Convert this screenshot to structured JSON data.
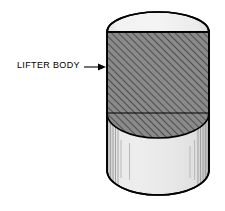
{
  "diagram": {
    "type": "engineering-section-drawing",
    "labels": [
      {
        "id": "lifter-body",
        "text": "LIFTER BODY",
        "text_x": 17,
        "text_y": 60,
        "leader": {
          "from_x": 84,
          "to_x": 106,
          "y": 67,
          "arrowhead": "right"
        }
      }
    ],
    "part": {
      "name": "lifter body",
      "shape": "cylinder",
      "left": 107,
      "right": 209,
      "width": 102,
      "top_apex_y": 12,
      "top_cap_line_y": 32,
      "section_bottom_line_y": 113,
      "section_arc_bottom_y": 138,
      "bottom_arc_y": 195,
      "ellipse_ry_top": 20,
      "ellipse_ry_bottom": 25
    },
    "hatching": {
      "angle_deg": 45,
      "direction": "lower-left-to-upper-right",
      "spacing_px": 5,
      "line_width_px": 1.1
    },
    "colors": {
      "outline": "#000000",
      "section_fill": "#8a8a8a",
      "hatch_line": "#1a1a1a",
      "top_cap_fill": "#f0f0f0",
      "lower_body_fill": "#e6e6e6",
      "shade_line": "#9a9a9a",
      "background": "#ffffff",
      "text": "#000000"
    }
  }
}
